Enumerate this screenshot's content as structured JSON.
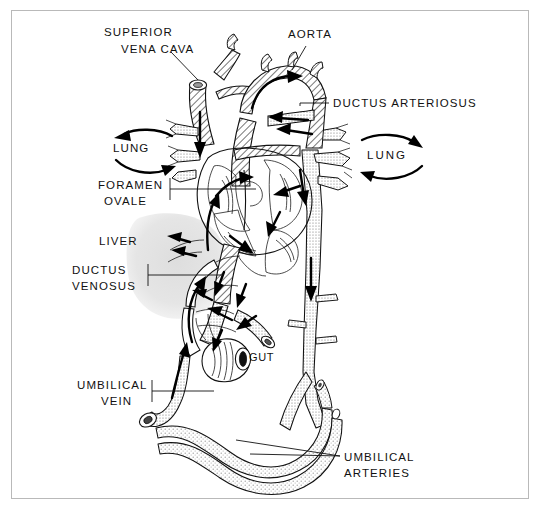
{
  "figure": {
    "border_color": "#b9b9b9",
    "background": "#ffffff",
    "ink_color": "#111111",
    "liver_fill": "#e3e3e3"
  },
  "labels": [
    {
      "id": "superior-vena-cava",
      "line1": "SUPERIOR",
      "line2": "VENA CAVA",
      "x": 104,
      "y": 36,
      "align": "start"
    },
    {
      "id": "aorta",
      "line1": "AORTA",
      "line2": "",
      "x": 288,
      "y": 38,
      "align": "start"
    },
    {
      "id": "ductus-arteriosus",
      "line1": "DUCTUS ARTERIOSUS",
      "line2": "",
      "x": 333,
      "y": 107,
      "align": "start"
    },
    {
      "id": "lung-left",
      "line1": "LUNG",
      "line2": "",
      "x": 113,
      "y": 152,
      "align": "start"
    },
    {
      "id": "lung-right",
      "line1": "LUNG",
      "line2": "",
      "x": 367,
      "y": 159,
      "align": "start"
    },
    {
      "id": "foramen-ovale",
      "line1": "FORAMEN",
      "line2": "OVALE",
      "x": 98,
      "y": 189,
      "align": "start"
    },
    {
      "id": "liver",
      "line1": "LIVER",
      "line2": "",
      "x": 99,
      "y": 245,
      "align": "start"
    },
    {
      "id": "ductus-venosus",
      "line1": "DUCTUS",
      "line2": "VENOSUS",
      "x": 72,
      "y": 274,
      "align": "start"
    },
    {
      "id": "gut",
      "line1": "GUT",
      "line2": "",
      "x": 249,
      "y": 361,
      "align": "start"
    },
    {
      "id": "umbilical-vein",
      "line1": "UMBILICAL",
      "line2": "VEIN",
      "x": 77,
      "y": 389,
      "align": "start"
    },
    {
      "id": "umbilical-arteries",
      "line1": "UMBILICAL",
      "line2": "ARTERIES",
      "x": 344,
      "y": 461,
      "align": "start"
    }
  ],
  "structures": [
    {
      "id": "superior-vena-cava",
      "kind": "vessel",
      "shading": "hatch"
    },
    {
      "id": "aortic-arch",
      "kind": "vessel",
      "shading": "hatch"
    },
    {
      "id": "ductus-arteriosus",
      "kind": "vessel",
      "shading": "hatch"
    },
    {
      "id": "pulmonary-artery",
      "kind": "vessel",
      "shading": "hatch"
    },
    {
      "id": "left-lung-vessels",
      "kind": "vessel",
      "shading": "stipple"
    },
    {
      "id": "right-lung-vessels",
      "kind": "vessel",
      "shading": "stipple"
    },
    {
      "id": "heart-chambers",
      "kind": "organ",
      "shading": "outline"
    },
    {
      "id": "foramen-ovale",
      "kind": "opening",
      "shading": "outline"
    },
    {
      "id": "liver",
      "kind": "organ",
      "shading": "solid-gray"
    },
    {
      "id": "ductus-venosus",
      "kind": "vessel",
      "shading": "outline"
    },
    {
      "id": "descending-aorta",
      "kind": "vessel",
      "shading": "stipple"
    },
    {
      "id": "inferior-vena-cava",
      "kind": "vessel",
      "shading": "hatch"
    },
    {
      "id": "gut",
      "kind": "organ",
      "shading": "outline"
    },
    {
      "id": "umbilical-vein",
      "kind": "vessel",
      "shading": "stipple"
    },
    {
      "id": "umbilical-arteries",
      "kind": "vessel",
      "shading": "stipple"
    }
  ],
  "flow_arrows": [
    {
      "id": "arrow-svc-down",
      "direction": "down"
    },
    {
      "id": "arrow-aortic-arch",
      "direction": "right"
    },
    {
      "id": "arrow-ductus-arteriosus",
      "direction": "left"
    },
    {
      "id": "arrow-ra-to-la",
      "direction": "up-right"
    },
    {
      "id": "arrow-ivc-up",
      "direction": "up"
    },
    {
      "id": "arrow-right-ventricle",
      "direction": "down-right"
    },
    {
      "id": "arrow-left-ventricle",
      "direction": "down"
    },
    {
      "id": "arrow-descending-aorta",
      "direction": "down"
    },
    {
      "id": "arrow-ductus-venosus-up",
      "direction": "up"
    },
    {
      "id": "arrow-umbilical-vein-up",
      "direction": "up"
    },
    {
      "id": "arrow-portal",
      "direction": "up-left"
    },
    {
      "id": "arrow-lung-left-out",
      "direction": "left"
    },
    {
      "id": "arrow-lung-left-in",
      "direction": "right"
    },
    {
      "id": "arrow-lung-right-out",
      "direction": "right"
    },
    {
      "id": "arrow-lung-right-in",
      "direction": "left"
    }
  ]
}
